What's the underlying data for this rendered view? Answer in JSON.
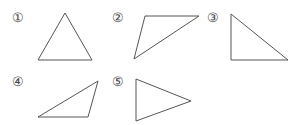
{
  "figures": [
    {
      "label": "①",
      "shape": "triangle",
      "kind": "acute/near-equilateral",
      "points": [
        [
          65,
          13
        ],
        [
          38,
          60
        ],
        [
          92,
          60
        ]
      ],
      "label_pos": [
        11,
        11
      ]
    },
    {
      "label": "②",
      "shape": "triangle",
      "kind": "obtuse",
      "points": [
        [
          145,
          16
        ],
        [
          199,
          16
        ],
        [
          134,
          59
        ]
      ],
      "label_pos": [
        111,
        11
      ]
    },
    {
      "label": "③",
      "shape": "triangle",
      "kind": "right",
      "points": [
        [
          231,
          14
        ],
        [
          231,
          60
        ],
        [
          288,
          60
        ]
      ],
      "label_pos": [
        206,
        11
      ]
    },
    {
      "label": "④",
      "shape": "triangle",
      "kind": "obtuse",
      "points": [
        [
          98,
          81
        ],
        [
          38,
          117
        ],
        [
          88,
          117
        ]
      ],
      "label_pos": [
        11,
        75
      ]
    },
    {
      "label": "⑤",
      "shape": "triangle",
      "kind": "isosceles",
      "points": [
        [
          136,
          79
        ],
        [
          136,
          121
        ],
        [
          191,
          101
        ]
      ],
      "label_pos": [
        111,
        75
      ]
    }
  ],
  "colors": {
    "stroke": "#555555",
    "label": "#444444",
    "background": "#ffffff"
  }
}
